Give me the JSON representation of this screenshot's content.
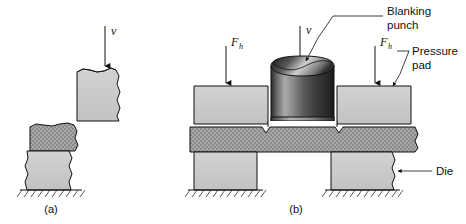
{
  "figure": {
    "background_color": "#ffffff",
    "line_color": "#111111",
    "colors": {
      "block_fill": "#c9c9c9",
      "sheet_fill": "#9a9a9a",
      "punch_dark": "#202020",
      "punch_light": "#d8d8d8",
      "gap_fill": "#ffffff"
    }
  },
  "panel_a": {
    "caption": "(a)",
    "velocity_label": "v",
    "parts": [
      {
        "name": "upper-punch-block",
        "kind": "block"
      },
      {
        "name": "sheet-metal",
        "kind": "sheet"
      },
      {
        "name": "lower-die-block",
        "kind": "block"
      },
      {
        "name": "ground",
        "kind": "hatched-ground"
      }
    ]
  },
  "panel_b": {
    "caption": "(b)",
    "velocity_label": "v",
    "holding_force_label": "F",
    "holding_force_subscript": "h",
    "callouts": [
      {
        "name": "blanking-punch",
        "line1": "Blanking",
        "line2": "punch"
      },
      {
        "name": "pressure-pad",
        "line1": "Pressure",
        "line2": "pad"
      },
      {
        "name": "die",
        "line1": "Die",
        "line2": ""
      }
    ],
    "parts": [
      {
        "name": "blanking-punch",
        "kind": "cylinder"
      },
      {
        "name": "pressure-pad-left",
        "kind": "block"
      },
      {
        "name": "pressure-pad-right",
        "kind": "block"
      },
      {
        "name": "sheet-metal",
        "kind": "sheet"
      },
      {
        "name": "die-left",
        "kind": "block"
      },
      {
        "name": "die-right",
        "kind": "block"
      },
      {
        "name": "ground-left",
        "kind": "hatched-ground"
      },
      {
        "name": "ground-right",
        "kind": "hatched-ground"
      }
    ]
  }
}
